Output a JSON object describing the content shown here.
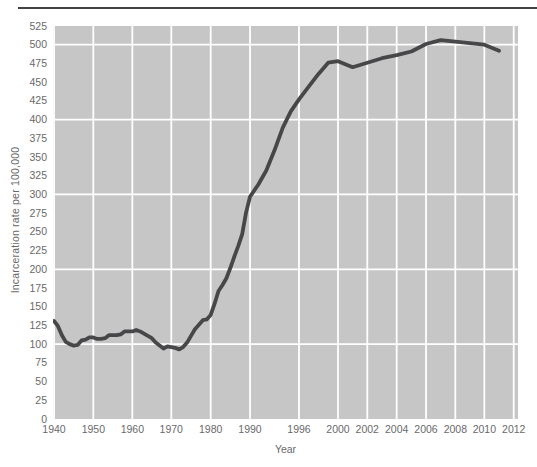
{
  "page": {
    "divider_color": "#424242"
  },
  "chart_data": {
    "type": "line",
    "title": "",
    "xlabel": "Year",
    "ylabel": "Incarceration rate per 100,000",
    "x_axis": {
      "tick_labels": [
        "1940",
        "1950",
        "1960",
        "1970",
        "1980",
        "1990",
        "1996",
        "2000",
        "2002",
        "2004",
        "2006",
        "2008",
        "2010",
        "2012"
      ],
      "tick_years": [
        1940,
        1950,
        1960,
        1970,
        1980,
        1990,
        1996,
        2000,
        2002,
        2004,
        2006,
        2008,
        2010,
        2012
      ],
      "tick_fracs": [
        0.0022,
        0.0867,
        0.1706,
        0.2544,
        0.3391,
        0.4237,
        0.529,
        0.6129,
        0.6759,
        0.7391,
        0.8022,
        0.8652,
        0.9276,
        0.9908
      ]
    },
    "y_axis": {
      "tick_labels": [
        "525",
        "500",
        "475",
        "450",
        "425",
        "400",
        "375",
        "350",
        "325",
        "300",
        "275",
        "250",
        "225",
        "200",
        "175",
        "150",
        "125",
        "100",
        "75",
        "50",
        "25",
        "0"
      ],
      "tick_values": [
        525,
        500,
        475,
        450,
        425,
        400,
        375,
        350,
        325,
        300,
        275,
        250,
        225,
        200,
        175,
        150,
        125,
        100,
        75,
        50,
        25,
        0
      ],
      "min": 0,
      "max": 525,
      "tick_step": 25,
      "gridline_values": [
        100,
        200,
        300,
        400,
        500
      ]
    },
    "series": [
      {
        "name": "Incarceration rate per 100,000",
        "x": [
          1940,
          1941,
          1942,
          1943,
          1944,
          1945,
          1946,
          1947,
          1948,
          1949,
          1950,
          1951,
          1952,
          1953,
          1954,
          1955,
          1956,
          1957,
          1958,
          1959,
          1960,
          1961,
          1962,
          1963,
          1964,
          1965,
          1966,
          1967,
          1968,
          1969,
          1970,
          1971,
          1972,
          1973,
          1974,
          1975,
          1976,
          1977,
          1978,
          1979,
          1980,
          1981,
          1982,
          1983,
          1984,
          1985,
          1986,
          1987,
          1988,
          1989,
          1990,
          1991,
          1992,
          1993,
          1994,
          1995,
          1996,
          1997,
          1998,
          1999,
          2000,
          2001,
          2002,
          2003,
          2004,
          2005,
          2006,
          2007,
          2008,
          2009,
          2010,
          2011
        ],
        "y": [
          131,
          124,
          112,
          103,
          100,
          98,
          99,
          105,
          106,
          109,
          109,
          107,
          107,
          108,
          112,
          112,
          112,
          113,
          117,
          117,
          117,
          119,
          117,
          114,
          111,
          108,
          102,
          98,
          94,
          97,
          96,
          95,
          93,
          96,
          102,
          111,
          120,
          126,
          132,
          133,
          139,
          154,
          171,
          179,
          188,
          202,
          217,
          231,
          247,
          276,
          297,
          313,
          332,
          359,
          389,
          411,
          427,
          444,
          461,
          476,
          478,
          470,
          476,
          482,
          486,
          491,
          501,
          506,
          504,
          502,
          500,
          492
        ]
      }
    ],
    "colors": {
      "line": "#47474a",
      "plot_bg": "#c6c6c6",
      "gridline": "#ffffff",
      "text": "#69696b"
    }
  }
}
